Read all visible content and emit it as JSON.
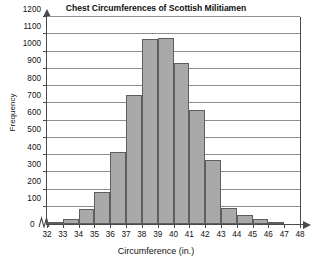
{
  "chart_data": {
    "type": "bar",
    "title": "Chest Circumferences of Scottish Militiamen",
    "xlabel": "Circumference (in.)",
    "ylabel": "Frequency",
    "grid": true,
    "legend": null,
    "xlim": [
      32,
      48
    ],
    "ylim": [
      0,
      1200
    ],
    "ytick_step": 100,
    "axis_break": true,
    "zero_label": "0",
    "bin_width": 1,
    "xtick_labels": [
      "32",
      "33",
      "34",
      "35",
      "36",
      "37",
      "38",
      "39",
      "40",
      "41",
      "42",
      "43",
      "44",
      "45",
      "46",
      "47",
      "48"
    ],
    "ytick_labels": [
      "100",
      "200",
      "300",
      "400",
      "500",
      "600",
      "700",
      "800",
      "900",
      "1000",
      "1100",
      "1200"
    ],
    "categories": [
      "32-33",
      "33-34",
      "34-35",
      "35-36",
      "36-37",
      "37-38",
      "38-39",
      "39-40",
      "40-41",
      "41-42",
      "42-43",
      "43-44",
      "44-45",
      "45-46",
      "46-47",
      "47-48"
    ],
    "bin_starts": [
      32,
      33,
      34,
      35,
      36,
      37,
      38,
      39,
      40,
      41,
      42,
      43,
      44,
      45,
      46,
      47
    ],
    "values": [
      5,
      30,
      85,
      185,
      420,
      750,
      1075,
      1080,
      935,
      660,
      370,
      95,
      55,
      30,
      8,
      0
    ],
    "colors": {
      "bar_fill": "#a9a9a9",
      "bar_border": "#5e5e5e",
      "axis": "#4a4a4a",
      "grid": "#8d8d8d",
      "text": "#111111",
      "background": "#ffffff"
    }
  }
}
